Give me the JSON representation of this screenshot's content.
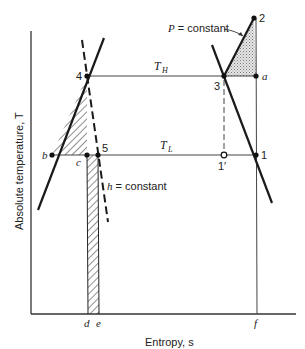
{
  "diagram": {
    "axes": {
      "x_label": "Entropy, s",
      "y_label": "Absolute temperature, T"
    },
    "isotherms": {
      "high": "T_H",
      "low": "T_L"
    },
    "annotations": {
      "pressure_line": "P = constant",
      "enthalpy_line": "h = constant"
    },
    "state_points": {
      "p1": "1",
      "p1prime": "1′",
      "p2": "2",
      "p3": "3",
      "p4": "4",
      "p5": "5",
      "pa": "a",
      "pb": "b",
      "pc": "c"
    },
    "x_axis_marks": {
      "d": "d",
      "e": "e",
      "f": "f"
    },
    "colors": {
      "line": "#1a1a1a",
      "thin_line": "#444444",
      "stipple": "#bbbbbb"
    }
  }
}
